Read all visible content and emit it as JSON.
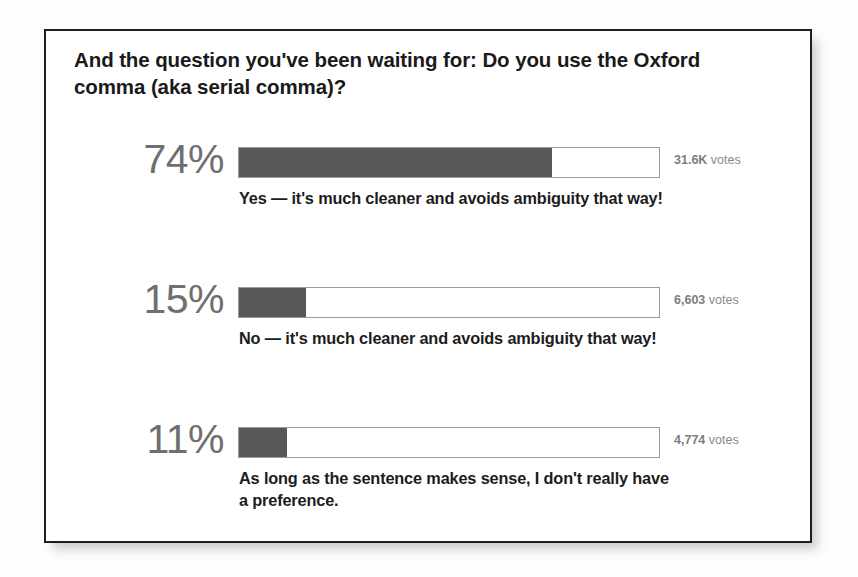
{
  "poll": {
    "question": "And the question you've been waiting for: Do you use the Oxford comma (aka serial comma)?",
    "options": [
      {
        "percent_label": "74%",
        "label": "Yes — it's much cleaner and avoids ambiguity that way!",
        "votes_count": "31.6K",
        "votes_word": "votes"
      },
      {
        "percent_label": "15%",
        "label": "No — it's much cleaner and avoids ambiguity that way!",
        "votes_count": "6,603",
        "votes_word": "votes"
      },
      {
        "percent_label": "11%",
        "label": "As long as the sentence makes sense, I don't really have a preference.",
        "votes_count": "4,774",
        "votes_word": "votes"
      }
    ]
  },
  "chart_data": {
    "type": "bar",
    "title": "And the question you've been waiting for: Do you use the Oxford comma (aka serial comma)?",
    "orientation": "horizontal",
    "categories": [
      "Yes — it's much cleaner and avoids ambiguity that way!",
      "No — it's much cleaner and avoids ambiguity that way!",
      "As long as the sentence makes sense, I don't really have a preference."
    ],
    "values": [
      74,
      15,
      11
    ],
    "value_unit": "percent",
    "data_labels": [
      "74%",
      "15%",
      "11%"
    ],
    "annotations": [
      "31.6K votes",
      "6,603 votes",
      "4,774 votes"
    ],
    "raw_counts": [
      31600,
      6603,
      4774
    ],
    "xlabel": "",
    "ylabel": "",
    "xlim": [
      0,
      100
    ],
    "grid": false,
    "legend": "none",
    "bar_color": "#585858",
    "track_color": "#ffffff",
    "track_border_color": "#9a9a9a"
  },
  "bar_fill_widths_px": [
    313,
    67,
    48
  ],
  "option_tops_px": [
    108,
    248,
    388
  ]
}
